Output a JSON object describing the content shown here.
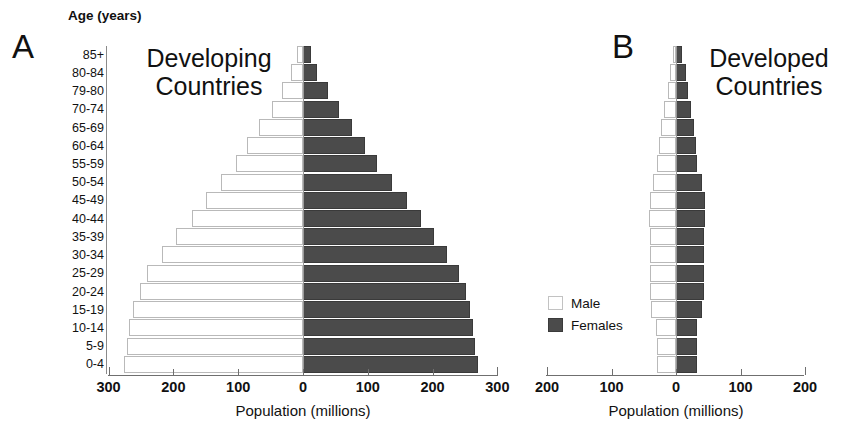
{
  "figure": {
    "axis_header": "Age (years)",
    "legend": {
      "male": {
        "label": "Male",
        "color": "#ffffff"
      },
      "female": {
        "label": "Females",
        "color": "#4b4b4b"
      }
    }
  },
  "panels": [
    {
      "letter": "A",
      "title": "Developing\nCountries",
      "xlabel": "Population (millions)",
      "xticks": [
        "300",
        "200",
        "100",
        "0",
        "100",
        "200",
        "300"
      ]
    },
    {
      "letter": "B",
      "title": "Developed\nCountries",
      "xlabel": "Population (millions)",
      "xticks": [
        "200",
        "100",
        "0",
        "100",
        "200"
      ]
    }
  ],
  "age_groups": [
    "85+",
    "80-84",
    "79-80",
    "70-74",
    "65-69",
    "60-64",
    "55-59",
    "50-54",
    "45-49",
    "40-44",
    "35-39",
    "30-34",
    "25-29",
    "20-24",
    "15-19",
    "10-14",
    "5-9",
    "0-4"
  ],
  "chart_data": [
    {
      "type": "bar",
      "title": "Developing Countries",
      "subtitle": "A",
      "xlabel": "Population (millions)",
      "ylabel": "Age (years)",
      "orientation": "horizontal",
      "layout": "population-pyramid",
      "grid": false,
      "legend_position": "right-of-plot",
      "xlim": [
        -300,
        300
      ],
      "xticks": [
        -300,
        -200,
        -100,
        0,
        100,
        200,
        300
      ],
      "xtick_labels": [
        "300",
        "200",
        "100",
        "0",
        "100",
        "200",
        "300"
      ],
      "categories": [
        "85+",
        "80-84",
        "79-80",
        "70-74",
        "65-69",
        "60-64",
        "55-59",
        "50-54",
        "45-49",
        "40-44",
        "35-39",
        "30-34",
        "25-29",
        "20-24",
        "15-19",
        "10-14",
        "5-9",
        "0-4"
      ],
      "series": [
        {
          "name": "Male",
          "side": "left",
          "color": "#ffffff",
          "values": [
            10,
            18,
            32,
            48,
            68,
            86,
            104,
            126,
            150,
            172,
            196,
            218,
            240,
            252,
            262,
            268,
            272,
            276
          ]
        },
        {
          "name": "Females",
          "side": "right",
          "color": "#4b4b4b",
          "values": [
            12,
            22,
            38,
            55,
            76,
            95,
            114,
            138,
            160,
            182,
            202,
            222,
            240,
            252,
            258,
            262,
            266,
            270
          ]
        }
      ]
    },
    {
      "type": "bar",
      "title": "Developed Countries",
      "subtitle": "B",
      "xlabel": "Population (millions)",
      "ylabel": "Age (years)",
      "orientation": "horizontal",
      "layout": "population-pyramid",
      "grid": false,
      "legend_position": "left-of-plot",
      "xlim": [
        -200,
        200
      ],
      "xticks": [
        -200,
        -100,
        0,
        100,
        200
      ],
      "xtick_labels": [
        "200",
        "100",
        "0",
        "100",
        "200"
      ],
      "categories": [
        "85+",
        "80-84",
        "79-80",
        "70-74",
        "65-69",
        "60-64",
        "55-59",
        "50-54",
        "45-49",
        "40-44",
        "35-39",
        "30-34",
        "25-29",
        "20-24",
        "15-19",
        "10-14",
        "5-9",
        "0-4"
      ],
      "series": [
        {
          "name": "Male",
          "side": "left",
          "color": "#ffffff",
          "values": [
            5,
            9,
            13,
            18,
            23,
            27,
            29,
            36,
            41,
            42,
            41,
            41,
            41,
            41,
            38,
            31,
            30,
            30
          ]
        },
        {
          "name": "Females",
          "side": "right",
          "color": "#4b4b4b",
          "values": [
            10,
            15,
            19,
            24,
            28,
            31,
            33,
            40,
            45,
            45,
            44,
            43,
            43,
            43,
            40,
            33,
            32,
            32
          ]
        }
      ]
    }
  ]
}
